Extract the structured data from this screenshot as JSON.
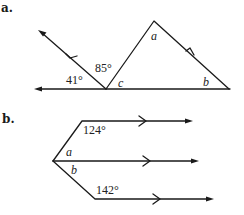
{
  "figure_a": {
    "part_label": "a.",
    "angles": {
      "left_angle": "41°",
      "middle_angle": "85°",
      "vertex_angle": "c",
      "apex_angle": "a",
      "right_angle": "b"
    }
  },
  "figure_b": {
    "part_label": "b.",
    "angles": {
      "upper_angle": "124°",
      "upper_inner": "a",
      "lower_inner": "b",
      "lower_angle": "142°"
    }
  }
}
